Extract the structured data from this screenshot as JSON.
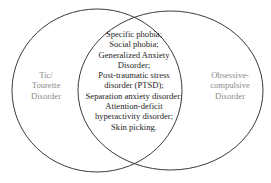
{
  "diagram": {
    "type": "venn",
    "sets": [
      {
        "id": "left",
        "label_lines": [
          "Tic/",
          "Tourette",
          "Disorder"
        ],
        "color": "#8a8a8a"
      },
      {
        "id": "right",
        "label_lines": [
          "Obsessive-",
          "compulsive",
          "Disorder"
        ],
        "color": "#9a9a9a"
      }
    ],
    "intersection": {
      "lines": [
        "Specific phobia;",
        "Social phobia;",
        "Generalized Anxiety",
        "Disorder;",
        "Post-traumatic stress",
        "disorder (PTSD);",
        "Separation anxiety disorder;",
        "Attention-deficit",
        "hyperactivity disorder;",
        "Skin picking."
      ],
      "color": "#1e1e1e"
    },
    "stroke_color": "#3a3a3a"
  }
}
